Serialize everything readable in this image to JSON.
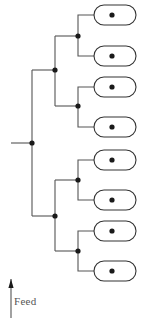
{
  "diagram": {
    "type": "binary-splitting-tree",
    "canvas": {
      "width": 141,
      "height": 318
    },
    "style": {
      "line_color": "#555555",
      "line_width": 1.1,
      "node_color": "#1a1a1a",
      "node_radius": 2.6,
      "loop_stroke": "#333333",
      "loop_fill": "#ffffff",
      "background": "#ffffff",
      "label_color": "#555555"
    },
    "feed": {
      "label": "Feed",
      "label_x": 14,
      "label_y": 305,
      "arrow_x": 11,
      "arrow_tail_y": 318,
      "arrow_tip_y": 279,
      "arrow_half_width": 2.6,
      "arrow_head_length": 9
    },
    "trunk": {
      "riser_x": 11,
      "riser_top_y": 143,
      "spine_y": 143,
      "spine_to_x": 32
    },
    "nodes": [
      {
        "id": "n0",
        "level": 0,
        "x": 32,
        "y": 143,
        "name": "split-node-level-0"
      },
      {
        "id": "n1",
        "level": 1,
        "x": 55,
        "y": 70,
        "name": "split-node-level-1-upper"
      },
      {
        "id": "n2",
        "level": 1,
        "x": 55,
        "y": 216,
        "name": "split-node-level-1-lower"
      },
      {
        "id": "n3",
        "level": 2,
        "x": 78,
        "y": 36,
        "name": "split-node-level-2-a"
      },
      {
        "id": "n4",
        "level": 2,
        "x": 78,
        "y": 106,
        "name": "split-node-level-2-b"
      },
      {
        "id": "n5",
        "level": 2,
        "x": 78,
        "y": 180,
        "name": "split-node-level-2-c"
      },
      {
        "id": "n6",
        "level": 2,
        "x": 78,
        "y": 251,
        "name": "split-node-level-2-d"
      }
    ],
    "branches": [
      {
        "name": "trunk-spine",
        "from_x": 11,
        "from_y": 143,
        "to_x": 32,
        "to_y": 143
      },
      {
        "name": "level0-riser-up",
        "from_x": 32,
        "from_y": 143,
        "to_x": 32,
        "to_y": 70
      },
      {
        "name": "level0-riser-down",
        "from_x": 32,
        "from_y": 143,
        "to_x": 32,
        "to_y": 216
      },
      {
        "name": "level0-to-n1",
        "from_x": 32,
        "from_y": 70,
        "to_x": 55,
        "to_y": 70
      },
      {
        "name": "level0-to-n2",
        "from_x": 32,
        "from_y": 216,
        "to_x": 55,
        "to_y": 216
      },
      {
        "name": "n1-riser-up",
        "from_x": 55,
        "from_y": 70,
        "to_x": 55,
        "to_y": 36
      },
      {
        "name": "n1-riser-down",
        "from_x": 55,
        "from_y": 70,
        "to_x": 55,
        "to_y": 106
      },
      {
        "name": "n1-to-n3",
        "from_x": 55,
        "from_y": 36,
        "to_x": 78,
        "to_y": 36
      },
      {
        "name": "n1-to-n4",
        "from_x": 55,
        "from_y": 106,
        "to_x": 78,
        "to_y": 106
      },
      {
        "name": "n2-riser-up",
        "from_x": 55,
        "from_y": 216,
        "to_x": 55,
        "to_y": 180
      },
      {
        "name": "n2-riser-down",
        "from_x": 55,
        "from_y": 216,
        "to_x": 55,
        "to_y": 251
      },
      {
        "name": "n2-to-n5",
        "from_x": 55,
        "from_y": 180,
        "to_x": 78,
        "to_y": 180
      },
      {
        "name": "n2-to-n6",
        "from_x": 55,
        "from_y": 251,
        "to_x": 78,
        "to_y": 251
      }
    ],
    "leaf_connectors": [
      {
        "name": "leaf-connector-1",
        "node_x": 78,
        "node_y": 36,
        "up_y": 15,
        "to_x": 105
      },
      {
        "name": "leaf-connector-2",
        "node_x": 78,
        "node_y": 36,
        "up_y": 56,
        "to_x": 105
      },
      {
        "name": "leaf-connector-3",
        "node_x": 78,
        "node_y": 106,
        "up_y": 87,
        "to_x": 105
      },
      {
        "name": "leaf-connector-4",
        "node_x": 78,
        "node_y": 106,
        "up_y": 127,
        "to_x": 105
      },
      {
        "name": "leaf-connector-5",
        "node_x": 78,
        "node_y": 180,
        "up_y": 160,
        "to_x": 105
      },
      {
        "name": "leaf-connector-6",
        "node_x": 78,
        "node_y": 180,
        "up_y": 200,
        "to_x": 105
      },
      {
        "name": "leaf-connector-7",
        "node_x": 78,
        "node_y": 251,
        "up_y": 231,
        "to_x": 105
      },
      {
        "name": "leaf-connector-8",
        "node_x": 78,
        "node_y": 251,
        "up_y": 271,
        "to_x": 105
      }
    ],
    "loops": [
      {
        "id": "L1",
        "name": "loop-reactor-1",
        "x": 94,
        "y": 15,
        "width": 42,
        "height": 20,
        "inlet_dot_x": 112,
        "inlet_dot_y": 15
      },
      {
        "id": "L2",
        "name": "loop-reactor-2",
        "x": 94,
        "y": 56,
        "width": 42,
        "height": 20,
        "inlet_dot_x": 112,
        "inlet_dot_y": 56
      },
      {
        "id": "L3",
        "name": "loop-reactor-3",
        "x": 94,
        "y": 87,
        "width": 42,
        "height": 20,
        "inlet_dot_x": 112,
        "inlet_dot_y": 87
      },
      {
        "id": "L4",
        "name": "loop-reactor-4",
        "x": 94,
        "y": 127,
        "width": 42,
        "height": 20,
        "inlet_dot_x": 112,
        "inlet_dot_y": 127
      },
      {
        "id": "L5",
        "name": "loop-reactor-5",
        "x": 94,
        "y": 160,
        "width": 42,
        "height": 20,
        "inlet_dot_x": 112,
        "inlet_dot_y": 160
      },
      {
        "id": "L6",
        "name": "loop-reactor-6",
        "x": 94,
        "y": 200,
        "width": 42,
        "height": 20,
        "inlet_dot_x": 112,
        "inlet_dot_y": 200
      },
      {
        "id": "L7",
        "name": "loop-reactor-7",
        "x": 94,
        "y": 231,
        "width": 42,
        "height": 20,
        "inlet_dot_x": 112,
        "inlet_dot_y": 231
      },
      {
        "id": "L8",
        "name": "loop-reactor-8",
        "x": 94,
        "y": 271,
        "width": 42,
        "height": 20,
        "inlet_dot_x": 112,
        "inlet_dot_y": 271
      }
    ],
    "counts": {
      "split_levels": 3,
      "split_nodes": 7,
      "loop_outlets": 8
    }
  }
}
